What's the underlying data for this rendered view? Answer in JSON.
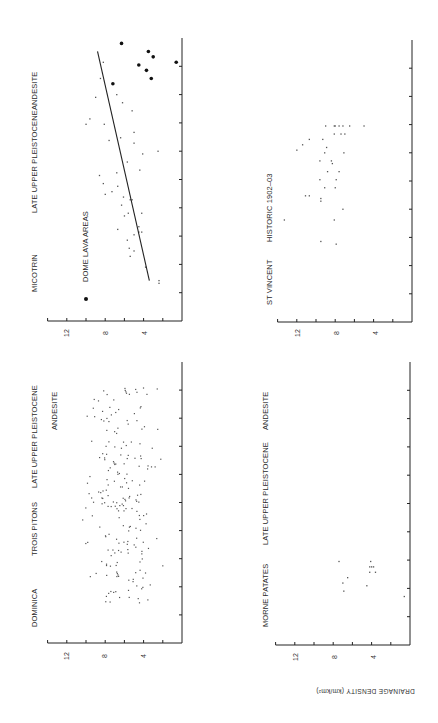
{
  "figure": {
    "orientation": "rotated 90 degrees counter-clockwise",
    "y_axis_title": "DRAINAGE DENSITY (km/km²)",
    "ink_color": "#222222",
    "background": "#ffffff"
  },
  "panels": [
    {
      "id": "micotrin",
      "labels": [
        "MICOTRIN",
        "LATE UPPER PLEISTOCENE",
        "ANDESITE"
      ],
      "legend": "DOME LAVA AREAS",
      "ticks": [
        "12",
        "8",
        "4"
      ]
    },
    {
      "id": "dominica",
      "labels": [
        "DOMINICA",
        "TROIS PITONS",
        "LATE UPPER PLEISTOCENE",
        "ANDESITE"
      ],
      "ticks": [
        "12",
        "8",
        "4"
      ]
    },
    {
      "id": "st-vincent",
      "labels": [
        "ST VINCENT",
        "HISTORIC 1902–03"
      ],
      "ticks": [
        "12",
        "8",
        "4"
      ]
    },
    {
      "id": "morne-patates",
      "labels": [
        "MORNE PATATES",
        "LATE UPPER PLEISTOCENE",
        "ANDESITE"
      ],
      "ticks": [
        "12",
        "8",
        "4"
      ]
    }
  ],
  "chart_data": [
    {
      "type": "scatter",
      "title": "MICOTRIN — LATE UPPER PLEISTOCENE — ANDESITE",
      "ylabel": "DRAINAGE DENSITY (km/km²)",
      "ylim": [
        0,
        14
      ],
      "yticks": [
        4,
        8,
        12
      ],
      "x_categories": 10,
      "legend": [
        {
          "marker": "filled-dot",
          "label": "DOME LAVA AREAS"
        }
      ],
      "trend_line": {
        "x": [
          1.5,
          10
        ],
        "y": [
          3.4,
          8.8
        ]
      },
      "series": [
        {
          "name": "points",
          "x": [
            1.4,
            1.5,
            2.0,
            2.4,
            2.6,
            2.7,
            3.0,
            3.2,
            3.3,
            3.3,
            3.4,
            3.5,
            3.9,
            4.0,
            4.0,
            4.3,
            4.5,
            4.5,
            4.6,
            4.7,
            4.8,
            5.0,
            5.1,
            5.4,
            5.5,
            5.6,
            5.9,
            6.2,
            6.3,
            6.6,
            6.7,
            6.8,
            7.0,
            7.3,
            7.3,
            7.5,
            7.8,
            8.1,
            8.3,
            8.4,
            9.0,
            9.6
          ],
          "y": [
            2.4,
            2.4,
            3.8,
            5.4,
            5.0,
            5.5,
            5.7,
            5.0,
            4.2,
            4.5,
            6.7,
            4.5,
            6.0,
            5.6,
            4.2,
            6.3,
            5.4,
            5.2,
            6.1,
            8.0,
            7.3,
            6.7,
            8.2,
            8.6,
            6.8,
            4.4,
            5.7,
            4.1,
            2.5,
            5.0,
            7.6,
            6.4,
            5.0,
            10.0,
            8.1,
            9.6,
            5.2,
            6.2,
            9.0,
            6.8,
            8.5,
            8.2
          ]
        },
        {
          "name": "DOME LAVA AREAS",
          "x": [
            8.8,
            9.5,
            9.3,
            9.8,
            9.0,
            10.3,
            10.0,
            9.6
          ],
          "y": [
            7.2,
            4.5,
            3.7,
            3.0,
            3.2,
            6.3,
            3.5,
            0.6
          ]
        }
      ]
    },
    {
      "type": "scatter",
      "title": "DOMINICA — TROIS PITONS — LATE UPPER PLEISTOCENE — ANDESITE",
      "ylabel": "DRAINAGE DENSITY (km/km²)",
      "ylim": [
        0,
        14
      ],
      "yticks": [
        4,
        8,
        12
      ],
      "x_categories": 10,
      "series": [
        {
          "name": "points",
          "note": "approx. 200 points clustered between x=1.5 and x=9.5, y mostly 4–9 (range ~2–11)",
          "y_range": [
            2.0,
            11.0
          ],
          "y_mean": 6.5
        }
      ]
    },
    {
      "type": "scatter",
      "title": "ST VINCENT — HISTORIC 1902–03",
      "ylabel": "DRAINAGE DENSITY (km/km²)",
      "ylim": [
        0,
        14
      ],
      "yticks": [
        4,
        8,
        12
      ],
      "x_categories": 10,
      "series": [
        {
          "name": "points",
          "x": [
            2.9,
            3.0,
            3.8,
            3.8,
            4.2,
            4.5,
            4.6,
            4.7,
            4.7,
            5.0,
            5.0,
            5.3,
            5.3,
            5.6,
            5.6,
            5.9,
            6.0,
            6.0,
            6.3,
            6.3,
            6.4,
            6.5,
            6.6,
            6.8,
            6.8,
            7.0,
            7.0,
            7.0,
            7.3,
            7.3,
            7.3,
            7.3,
            7.3,
            7.3,
            7.3
          ],
          "y": [
            7.9,
            9.5,
            13.3,
            8.1,
            7.2,
            9.5,
            9.5,
            11.1,
            10.7,
            9.1,
            8.0,
            9.6,
            7.9,
            8.8,
            7.6,
            8.3,
            9.6,
            8.4,
            9.1,
            7.1,
            12.0,
            8.9,
            11.4,
            9.3,
            10.7,
            8.1,
            7.4,
            7.0,
            9.0,
            8.1,
            8.0,
            7.6,
            7.2,
            6.5,
            5.0
          ]
        }
      ]
    },
    {
      "type": "scatter",
      "title": "MORNE PATATES — LATE UPPER PLEISTOCENE — ANDESITE",
      "ylabel": "DRAINAGE DENSITY (km/km²)",
      "ylim": [
        0,
        14
      ],
      "yticks": [
        4,
        8,
        12
      ],
      "x_categories": 10,
      "series": [
        {
          "name": "points",
          "x": [
            1.8,
            2.0,
            2.3,
            2.2,
            2.5,
            2.7,
            2.7,
            2.9,
            2.9,
            2.9,
            3.1,
            3.1
          ],
          "y": [
            0.6,
            6.9,
            7.0,
            4.5,
            6.5,
            4.2,
            3.6,
            4.2,
            3.8,
            4.0,
            4.1,
            7.4
          ]
        }
      ]
    }
  ]
}
